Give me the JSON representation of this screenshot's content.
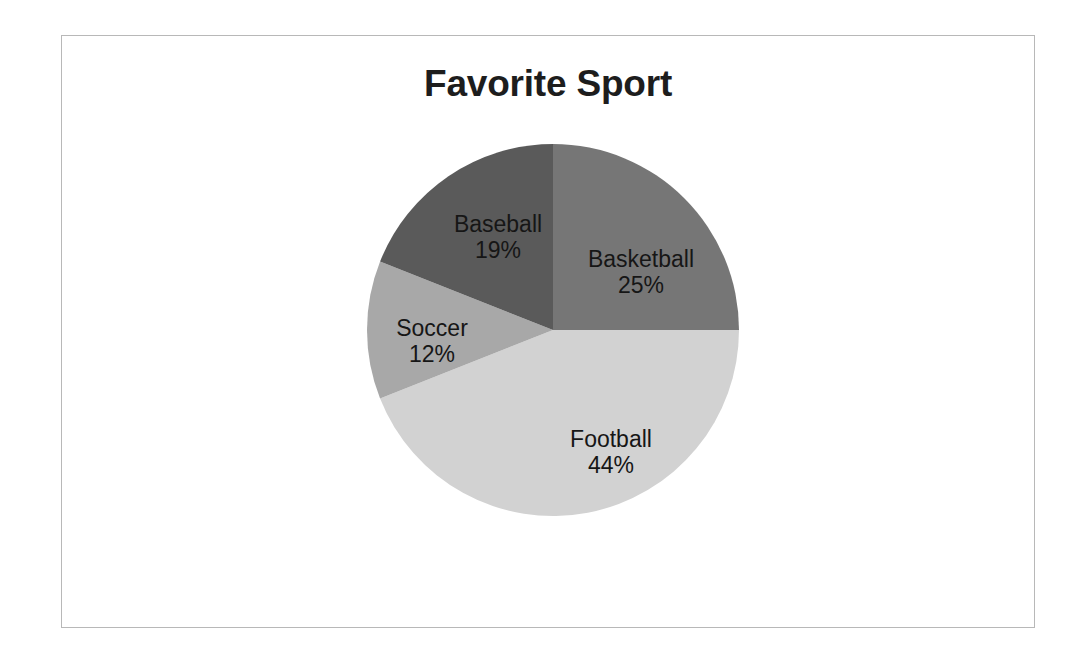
{
  "chart_data": {
    "type": "pie",
    "title": "Favorite Sport",
    "categories": [
      "Basketball",
      "Football",
      "Soccer",
      "Baseball"
    ],
    "values": [
      25,
      44,
      12,
      19
    ],
    "value_labels": [
      "25%",
      "44%",
      "12%",
      "19%"
    ],
    "units": "percent",
    "legend": "none",
    "labels_position": "inside-slices",
    "start_angle_deg": 0,
    "direction": "clockwise",
    "slices": [
      {
        "name": "Basketball",
        "value": 25,
        "label": "Basketball",
        "percent_label": "25%",
        "color": "#767676",
        "start_deg": 0,
        "end_deg": 90
      },
      {
        "name": "Football",
        "value": 44,
        "label": "Football",
        "percent_label": "44%",
        "color": "#d2d2d2",
        "start_deg": 90,
        "end_deg": 248.4
      },
      {
        "name": "Soccer",
        "value": 12,
        "label": "Soccer",
        "percent_label": "12%",
        "color": "#a8a8a8",
        "start_deg": 248.4,
        "end_deg": 291.6
      },
      {
        "name": "Baseball",
        "value": 19,
        "label": "Baseball",
        "percent_label": "19%",
        "color": "#5a5a5a",
        "start_deg": 291.6,
        "end_deg": 360
      }
    ]
  },
  "frame": {
    "border_color": "#b8b8b8",
    "background": "#ffffff"
  }
}
